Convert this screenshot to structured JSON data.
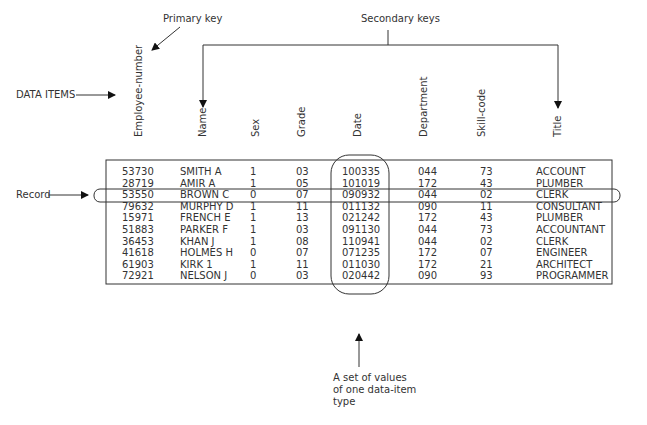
{
  "annotations": {
    "primary_key": "Primary key",
    "secondary_keys": "Secondary keys",
    "data_items": "DATA ITEMS",
    "record": "Record",
    "set_of_values_line1": "A set of values",
    "set_of_values_line2": "of one data-item",
    "set_of_values_line3": "type"
  },
  "table": {
    "columns": [
      "Employee-number",
      "Name",
      "Sex",
      "Grade",
      "Date",
      "Department",
      "Skill-code",
      "Title"
    ],
    "rows": [
      [
        "53730",
        "SMITH A",
        "1",
        "03",
        "100335",
        "044",
        "73",
        "ACCOUNT"
      ],
      [
        "28719",
        "AMIR A",
        "1",
        "05",
        "101019",
        "172",
        "43",
        "PLUMBER"
      ],
      [
        "53550",
        "BROWN C",
        "0",
        "07",
        "090932",
        "044",
        "02",
        "CLERK"
      ],
      [
        "79632",
        "MURPHY D",
        "1",
        "11",
        "011132",
        "090",
        "11",
        "CONSULTANT"
      ],
      [
        "15971",
        "FRENCH E",
        "1",
        "13",
        "021242",
        "172",
        "43",
        "PLUMBER"
      ],
      [
        "51883",
        "PARKER F",
        "1",
        "03",
        "091130",
        "044",
        "73",
        "ACCOUNTANT"
      ],
      [
        "36453",
        "KHAN J",
        "1",
        "08",
        "110941",
        "044",
        "02",
        "CLERK"
      ],
      [
        "41618",
        "HOLMES H",
        "0",
        "07",
        "071235",
        "172",
        "07",
        "ENGINEER"
      ],
      [
        "61903",
        "KIRK 1",
        "1",
        "11",
        "011030",
        "172",
        "21",
        "ARCHITECT"
      ],
      [
        "72921",
        "NELSON J",
        "0",
        "03",
        "020442",
        "090",
        "93",
        "PROGRAMMER"
      ]
    ]
  }
}
